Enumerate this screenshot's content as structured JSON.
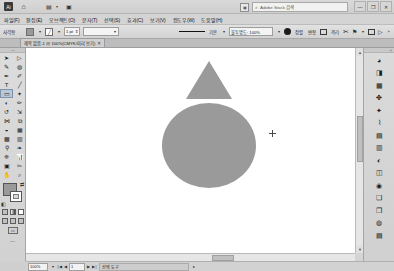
{
  "app": {
    "name": "Adobe Illustrator",
    "logo_text": "Ai"
  },
  "titlebar": {
    "home_icon": "home-icon",
    "open_files_icon": "open-files-icon",
    "save_icon": "save-icon",
    "caret": "▾",
    "stock_icon": "adobe-stock-icon",
    "search_icon": "⌕",
    "search_placeholder": "Adobe Stock 검색",
    "minimize": "—",
    "restore": "❐",
    "close": "✕"
  },
  "menubar": {
    "items": [
      {
        "label": "파일(F)"
      },
      {
        "label": "편집(E)"
      },
      {
        "label": "오브젝트(O)"
      },
      {
        "label": "문자(T)"
      },
      {
        "label": "선택(S)"
      },
      {
        "label": "효과(C)"
      },
      {
        "label": "보기(V)"
      },
      {
        "label": "윈도우(W)"
      },
      {
        "label": "도움말(H)"
      }
    ]
  },
  "controlbar": {
    "selection_label": "사각형",
    "fill_color": "#9a9a9a",
    "stroke_color": "#ffffff",
    "stroke_weight_value": "1 pt",
    "stroke_profile_value": "",
    "stroke_style_label": "기본",
    "brush_label": "불투명도: 100%",
    "opacity_caret": "▾",
    "style_swatch": "style-swatch",
    "buttons": [
      {
        "label": "정렬"
      },
      {
        "label": "변형"
      },
      {
        "label": ""
      },
      {
        "label": "격리"
      }
    ],
    "transform_icon": "✂",
    "flag_icon": "⚑",
    "arrange_icon": "▤",
    "doc_setup_icon": "▷",
    "overflow": "»"
  },
  "tabbar": {
    "document_title": "제목 없음-1 @ 100%(CMYK/미리 보기)",
    "close": "✕"
  },
  "toolpanel": {
    "grip": "⋯",
    "tools": [
      {
        "name": "selection-tool",
        "glyph": "➤",
        "selected": false
      },
      {
        "name": "direct-selection-tool",
        "glyph": "▷",
        "selected": false
      },
      {
        "name": "magic-wand-tool",
        "glyph": "✎",
        "selected": false
      },
      {
        "name": "lasso-tool",
        "glyph": "◍",
        "selected": false
      },
      {
        "name": "pen-tool",
        "glyph": "✒",
        "selected": false
      },
      {
        "name": "curvature-tool",
        "glyph": "✐",
        "selected": false
      },
      {
        "name": "type-tool",
        "glyph": "T",
        "selected": false
      },
      {
        "name": "line-segment-tool",
        "glyph": "╱",
        "selected": false
      },
      {
        "name": "rectangle-tool",
        "glyph": "▭",
        "selected": true
      },
      {
        "name": "paintbrush-tool",
        "glyph": "✦",
        "selected": false
      },
      {
        "name": "shaper-tool",
        "glyph": "◐",
        "selected": false
      },
      {
        "name": "pencil-tool",
        "glyph": "✏",
        "selected": false
      },
      {
        "name": "rotate-tool",
        "glyph": "↺",
        "selected": false
      },
      {
        "name": "scale-tool",
        "glyph": "⇲",
        "selected": false
      },
      {
        "name": "width-tool",
        "glyph": "⋈",
        "selected": false
      },
      {
        "name": "free-transform-tool",
        "glyph": "⧉",
        "selected": false
      },
      {
        "name": "shape-builder-tool",
        "glyph": "◒",
        "selected": false
      },
      {
        "name": "perspective-grid-tool",
        "glyph": "▦",
        "selected": false
      },
      {
        "name": "mesh-tool",
        "glyph": "▩",
        "selected": false
      },
      {
        "name": "gradient-tool",
        "glyph": "▥",
        "selected": false
      },
      {
        "name": "eyedropper-tool",
        "glyph": "⚲",
        "selected": false
      },
      {
        "name": "blend-tool",
        "glyph": "❧",
        "selected": false
      },
      {
        "name": "symbol-sprayer-tool",
        "glyph": "❈",
        "selected": false
      },
      {
        "name": "column-graph-tool",
        "glyph": "📊",
        "selected": false
      },
      {
        "name": "artboard-tool",
        "glyph": "▣",
        "selected": false
      },
      {
        "name": "slice-tool",
        "glyph": "✂",
        "selected": false
      },
      {
        "name": "hand-tool",
        "glyph": "✋",
        "selected": false
      },
      {
        "name": "zoom-tool",
        "glyph": "⌕",
        "selected": false
      }
    ],
    "fill_color": "#9a9a9a",
    "stroke_color": "#ffffff",
    "swap_icon": "⇄",
    "default_icon": "◧",
    "mini_swatches": [
      {
        "name": "color-swatch",
        "type": "solid"
      },
      {
        "name": "gradient-swatch",
        "type": "gradient"
      },
      {
        "name": "none-swatch",
        "type": "none"
      }
    ],
    "screen_modes": [
      {
        "name": "drawing-mode-normal",
        "glyph": "▣"
      },
      {
        "name": "drawing-mode-behind",
        "glyph": "▤"
      },
      {
        "name": "screen-mode",
        "glyph": "▢"
      }
    ],
    "screen_mode_button": "▭",
    "overflow": "⋯"
  },
  "canvas": {
    "shapes": [
      {
        "name": "triangle-shape",
        "type": "triangle",
        "fill": "#9a9a9a"
      },
      {
        "name": "circle-shape",
        "type": "ellipse",
        "fill": "#9a9a9a"
      }
    ],
    "cursor": "crosshair-cursor"
  },
  "rightdock": {
    "grip": "«",
    "panels": [
      {
        "name": "panel-color",
        "glyph": "◕"
      },
      {
        "name": "panel-color-guide",
        "glyph": "◨"
      },
      {
        "name": "panel-swatches",
        "glyph": "▦"
      },
      {
        "name": "panel-brushes",
        "glyph": "✤"
      },
      {
        "name": "panel-symbols",
        "glyph": "✦"
      },
      {
        "name": "panel-stroke",
        "glyph": "⌇"
      },
      {
        "name": "panel-paragraph",
        "glyph": "▤"
      },
      {
        "name": "panel-gradient",
        "glyph": "▥"
      },
      {
        "name": "panel-transparency",
        "glyph": "◐"
      },
      {
        "name": "panel-appearance",
        "glyph": "◫"
      },
      {
        "name": "panel-graphic-styles",
        "glyph": "◉"
      },
      {
        "name": "panel-layers",
        "glyph": "❏"
      },
      {
        "name": "panel-artboards",
        "glyph": "❐"
      },
      {
        "name": "panel-links",
        "glyph": "◍"
      },
      {
        "name": "panel-libraries",
        "glyph": "▤"
      }
    ]
  },
  "scrollbars": {
    "up_arrow": "▲",
    "down_arrow": "▼",
    "left_arrow": "◀",
    "right_arrow": "▶"
  },
  "statusbar": {
    "zoom_value": "100%",
    "zoom_caret": "▾",
    "first_page": "|◀",
    "prev_page": "◀",
    "page_value": "1",
    "next_page": "▶",
    "last_page": "▶|",
    "status_text": "선택 도구",
    "status_caret": "▸",
    "resize_grip": "◢"
  }
}
